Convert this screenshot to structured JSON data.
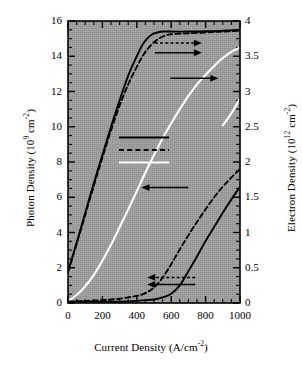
{
  "chart_data": {
    "type": "line",
    "title": "",
    "xlabel": "Current Density (A/cm-2)",
    "xlabel_base": "Current Density (A/cm",
    "xlabel_exp": "-2",
    "xlabel_tail": ")",
    "ylabel_left_base": "Photon Density (10",
    "ylabel_left_exp1": "9",
    "ylabel_left_mid": " cm",
    "ylabel_left_exp2": "-2",
    "ylabel_left_tail": ")",
    "ylabel_right_base": "Electron Density (10",
    "ylabel_right_exp1": "12",
    "ylabel_right_mid": " cm",
    "ylabel_right_exp2": "-2",
    "ylabel_right_tail": ")",
    "xlim": [
      0,
      1000
    ],
    "ylim_left": [
      0,
      16
    ],
    "ylim_right": [
      0,
      4
    ],
    "xticks": [
      0,
      200,
      400,
      600,
      800,
      1000
    ],
    "xtick_labels": [
      "0",
      "200",
      "400",
      "600",
      "800",
      "1000"
    ],
    "yticks_left": [
      0,
      2,
      4,
      6,
      8,
      10,
      12,
      14,
      16
    ],
    "ytick_labels_left": [
      "0",
      "2",
      "4",
      "6",
      "8",
      "10",
      "12",
      "14",
      "16"
    ],
    "yticks_right": [
      0,
      0.5,
      1,
      1.5,
      2,
      2.5,
      3,
      3.5,
      4
    ],
    "ytick_labels_right": [
      "0",
      "0.5",
      "1",
      "1.5",
      "2",
      "2.5",
      "3",
      "3.5",
      "4"
    ],
    "grid": false,
    "plot_background": "#9a9a9a",
    "legend_position": "center-left",
    "legend": [
      {
        "label_prefix": "β = 10",
        "label_exp": "-5",
        "style": "solid",
        "color": "#000000"
      },
      {
        "label_prefix": "β = 10",
        "label_exp": "-4",
        "style": "dashed",
        "color": "#000000"
      },
      {
        "label_prefix": "β = 10",
        "label_exp": "-3",
        "style": "solid",
        "color": "#ffffff"
      }
    ],
    "annotations": [
      {
        "name": "arrow-right-beta4-photon",
        "direction": "right",
        "x_from": 505,
        "y_axis": "left",
        "y_val": 14.75
      },
      {
        "name": "arrow-right-beta5-photon",
        "direction": "right",
        "x_from": 505,
        "y_axis": "left",
        "y_val": 14.2
      },
      {
        "name": "arrow-right-beta3-photon",
        "direction": "right",
        "x_from": 595,
        "y_axis": "left",
        "y_val": 12.75
      },
      {
        "name": "arrow-left-legend",
        "direction": "left",
        "x_from": 700,
        "y_axis": "left",
        "y_val": 6.55
      },
      {
        "name": "arrow-left-beta4-electron",
        "direction": "left",
        "x_from": 740,
        "y_axis": "left",
        "y_val": 1.45
      },
      {
        "name": "arrow-left-beta5-electron",
        "direction": "left",
        "x_from": 740,
        "y_axis": "left",
        "y_val": 1.05
      }
    ],
    "series": [
      {
        "name": "photon-beta-1e-5",
        "quantity": "Photon Density",
        "beta": "10^-5",
        "axis": "left",
        "style": "solid",
        "color": "#000000",
        "x": [
          0,
          25,
          50,
          100,
          150,
          200,
          250,
          300,
          350,
          400,
          430,
          460,
          490,
          520,
          560,
          600,
          700,
          800,
          900,
          1000
        ],
        "y": [
          1.8,
          2.6,
          3.4,
          5.1,
          6.8,
          8.4,
          10.0,
          11.5,
          12.9,
          14.0,
          14.6,
          15.0,
          15.25,
          15.35,
          15.4,
          15.4,
          15.4,
          15.42,
          15.45,
          15.5
        ]
      },
      {
        "name": "photon-beta-1e-4",
        "quantity": "Photon Density",
        "beta": "10^-4",
        "axis": "left",
        "style": "dashed",
        "color": "#000000",
        "x": [
          0,
          25,
          50,
          100,
          150,
          200,
          250,
          300,
          350,
          400,
          440,
          480,
          520,
          560,
          600,
          700,
          800,
          900,
          1000
        ],
        "y": [
          1.75,
          2.55,
          3.35,
          5.0,
          6.65,
          8.25,
          9.8,
          11.2,
          12.4,
          13.4,
          14.1,
          14.6,
          14.95,
          15.15,
          15.25,
          15.3,
          15.35,
          15.4,
          15.45
        ]
      },
      {
        "name": "photon-beta-1e-3",
        "quantity": "Photon Density",
        "beta": "10^-3",
        "axis": "left",
        "style": "solid",
        "color": "#ffffff",
        "x": [
          0,
          50,
          100,
          150,
          200,
          250,
          300,
          350,
          400,
          450,
          500,
          550,
          600,
          650,
          700,
          750,
          800,
          850,
          900,
          950,
          1000
        ],
        "y": [
          0.1,
          0.45,
          0.95,
          1.6,
          2.4,
          3.3,
          4.3,
          5.3,
          6.35,
          7.4,
          8.4,
          9.35,
          10.2,
          11.0,
          11.75,
          12.4,
          12.95,
          13.45,
          13.9,
          14.25,
          14.5
        ]
      },
      {
        "name": "electron-beta-1e-5",
        "quantity": "Electron Density",
        "beta": "10^-5",
        "axis": "right",
        "style": "solid",
        "color": "#000000",
        "x": [
          0,
          100,
          200,
          300,
          400,
          450,
          500,
          550,
          600,
          650,
          700,
          750,
          800,
          850,
          900,
          950,
          1000
        ],
        "y": [
          0.02,
          0.02,
          0.02,
          0.02,
          0.03,
          0.04,
          0.05,
          0.08,
          0.13,
          0.25,
          0.45,
          0.66,
          0.88,
          1.08,
          1.28,
          1.47,
          1.65
        ]
      },
      {
        "name": "electron-beta-1e-4",
        "quantity": "Electron Density",
        "beta": "10^-4",
        "axis": "right",
        "style": "dashed",
        "color": "#000000",
        "x": [
          0,
          100,
          200,
          250,
          300,
          350,
          400,
          450,
          500,
          550,
          600,
          650,
          700,
          750,
          800,
          850,
          900,
          950,
          1000
        ],
        "y": [
          0.02,
          0.03,
          0.04,
          0.05,
          0.06,
          0.08,
          0.1,
          0.14,
          0.22,
          0.36,
          0.55,
          0.76,
          0.96,
          1.15,
          1.33,
          1.5,
          1.65,
          1.78,
          1.9
        ]
      },
      {
        "name": "electron-beta-1e-3",
        "quantity": "Electron Density",
        "beta": "10^-3",
        "axis": "right",
        "style": "solid",
        "color": "#ffffff",
        "x": [
          900,
          930,
          960,
          1000
        ],
        "y": [
          2.52,
          2.62,
          2.73,
          2.9
        ]
      }
    ]
  }
}
